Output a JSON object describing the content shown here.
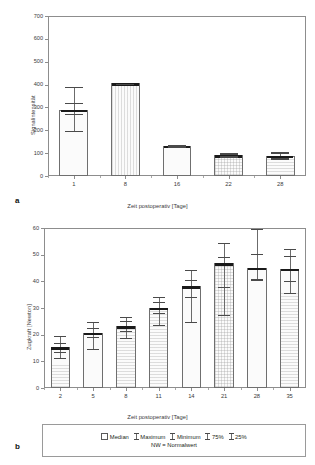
{
  "figure": {
    "panel_a_letter": "a",
    "panel_b_letter": "b"
  },
  "legend": {
    "items": [
      {
        "label": "Median",
        "marker": "box"
      },
      {
        "label": "Maximum",
        "marker": "whisker-top"
      },
      {
        "label": "Minimum",
        "marker": "whisker-bottom"
      },
      {
        "label": "75%",
        "marker": "whisker-upper-quartile"
      },
      {
        "label": "25%",
        "marker": "whisker-lower-quartile"
      }
    ],
    "note": "NW = Normalwert"
  },
  "chart_data": [
    {
      "type": "bar",
      "id": "panel-a",
      "title": "",
      "xlabel": "Zeit postoperativ [Tage]",
      "ylabel": "Signalintensität",
      "categories": [
        "1",
        "8",
        "16",
        "22",
        "28"
      ],
      "values": [
        290,
        405,
        132,
        90,
        89
      ],
      "ylim": [
        0,
        700
      ],
      "yticks": [
        0,
        100,
        200,
        300,
        400,
        500,
        600,
        700
      ],
      "grid": false,
      "legend_position": "external-bottom",
      "error_stats": [
        {
          "category": "1",
          "median": 290,
          "q75": 320,
          "q25": 272,
          "max": 390,
          "min": 195
        },
        {
          "category": "8",
          "median": 405,
          "q75": 406,
          "q25": 404,
          "max": 407,
          "min": 403
        },
        {
          "category": "16",
          "median": 132,
          "q75": 134,
          "q25": 130,
          "max": 136,
          "min": 128
        },
        {
          "category": "22",
          "median": 90,
          "q75": 96,
          "q25": 86,
          "max": 100,
          "min": 82
        },
        {
          "category": "28",
          "median": 89,
          "q75": 99,
          "q25": 80,
          "max": 105,
          "min": 74
        }
      ]
    },
    {
      "type": "bar",
      "id": "panel-b",
      "title": "",
      "xlabel": "Zeit postoperativ [Tage]",
      "ylabel": "Zugkraft [Newton]",
      "categories": [
        "2",
        "5",
        "8",
        "11",
        "14",
        "21",
        "28",
        "35"
      ],
      "values": [
        15.3,
        20.8,
        23.2,
        30.1,
        38.1,
        46.8,
        45.1,
        44.8
      ],
      "ylim": [
        0,
        60
      ],
      "yticks": [
        0,
        10,
        20,
        30,
        40,
        50,
        60
      ],
      "grid": false,
      "legend_position": "external-bottom",
      "error_stats": [
        {
          "category": "2",
          "median": 15.3,
          "q75": 16.8,
          "q25": 13.6,
          "max": 19.6,
          "min": 11.4
        },
        {
          "category": "5",
          "median": 20.8,
          "q75": 22.4,
          "q25": 19.0,
          "max": 24.8,
          "min": 14.6
        },
        {
          "category": "8",
          "median": 23.2,
          "q75": 25.0,
          "q25": 21.3,
          "max": 26.8,
          "min": 18.7
        },
        {
          "category": "11",
          "median": 30.1,
          "q75": 32.2,
          "q25": 28.3,
          "max": 34.0,
          "min": 23.7
        },
        {
          "category": "14",
          "median": 38.1,
          "q75": 40.5,
          "q25": 34.3,
          "max": 44.3,
          "min": 24.9
        },
        {
          "category": "21",
          "median": 46.8,
          "q75": 49.2,
          "q25": 38.0,
          "max": 54.4,
          "min": 27.2
        },
        {
          "category": "28",
          "median": 45.1,
          "q75": 50.3,
          "q25": 40.7,
          "max": 59.5,
          "min": 40.6
        },
        {
          "category": "35",
          "median": 44.8,
          "q75": 49.6,
          "q25": 40.1,
          "max": 52.3,
          "min": 35.8
        }
      ]
    }
  ]
}
